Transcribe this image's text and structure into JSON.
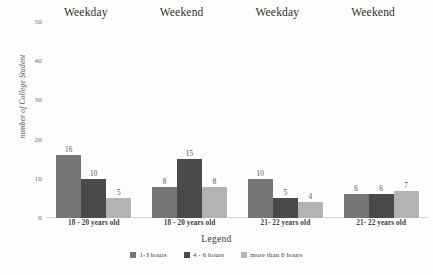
{
  "chart_data": {
    "type": "bar",
    "title": "",
    "subtitle": "",
    "xlabel": "Legend",
    "ylabel": "number of College Student",
    "ylim": [
      0,
      50
    ],
    "yticks": [
      0,
      10,
      20,
      30,
      40,
      50
    ],
    "grid": false,
    "legend_position": "bottom",
    "categories": [
      "18 - 20 years old",
      "18 - 20  years old",
      "21-  22  years old",
      "21-  22  years old"
    ],
    "group_headers": [
      "Weekday",
      "Weekend",
      "Weekday",
      "Weekend"
    ],
    "series": [
      {
        "name": "1-3 hours",
        "color": "#757575",
        "values": [
          16,
          8,
          10,
          6
        ]
      },
      {
        "name": "4 - 6 hours",
        "color": "#4a4a4a",
        "values": [
          10,
          15,
          5,
          6
        ]
      },
      {
        "name": "more than 6 hours",
        "color": "#b3b3b3",
        "values": [
          5,
          8,
          4,
          7
        ]
      }
    ]
  },
  "legend": {
    "items": [
      {
        "label": "1-3 hours",
        "color": "#757575"
      },
      {
        "label": "4 - 6 hours",
        "color": "#4a4a4a"
      },
      {
        "label": "more than 6 hours",
        "color": "#b3b3b3"
      }
    ]
  }
}
